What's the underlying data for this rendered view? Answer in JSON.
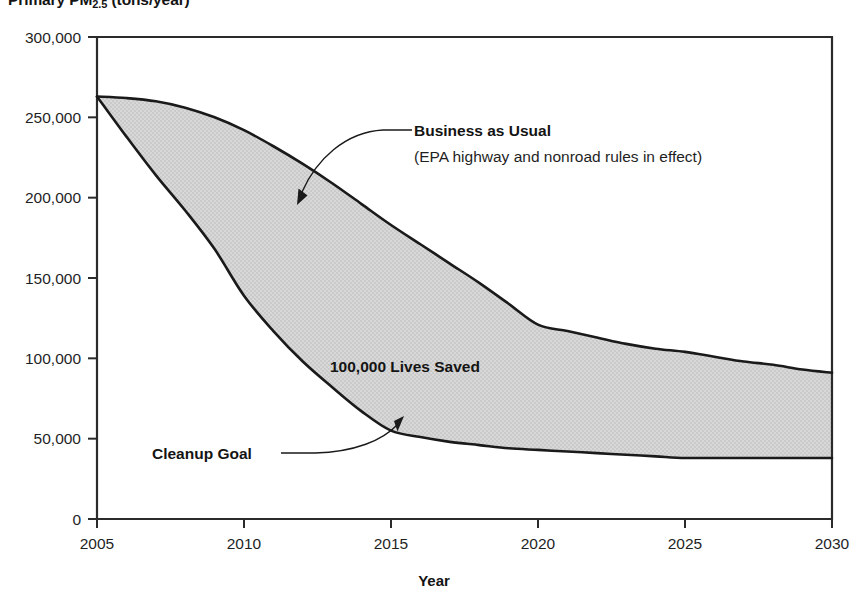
{
  "chart_data": {
    "type": "area",
    "title": "Primary PM2.5 (tons/year)",
    "title_prefix": "Primary PM",
    "title_sub": "2.5",
    "title_suffix": " (tons/year)",
    "xlabel": "Year",
    "ylabel": "Primary PM2.5 (tons/year)",
    "xlim": [
      2005,
      2030
    ],
    "ylim": [
      0,
      300000
    ],
    "grid": false,
    "legend_position": "inline-annotations",
    "x_ticks": [
      "2005",
      "2010",
      "2015",
      "2020",
      "2025",
      "2030"
    ],
    "x_tick_values": [
      2005,
      2010,
      2015,
      2020,
      2025,
      2030
    ],
    "y_ticks": [
      "0",
      "50,000",
      "100,000",
      "150,000",
      "200,000",
      "250,000",
      "300,000"
    ],
    "y_tick_values": [
      0,
      50000,
      100000,
      150000,
      200000,
      250000,
      300000
    ],
    "x": [
      2005,
      2006,
      2007,
      2008,
      2009,
      2010,
      2011,
      2012,
      2013,
      2014,
      2015,
      2016,
      2017,
      2018,
      2019,
      2020,
      2021,
      2022,
      2023,
      2024,
      2025,
      2026,
      2027,
      2028,
      2029,
      2030
    ],
    "series": [
      {
        "name": "Business as Usual",
        "sublabel": "(EPA highway and nonroad rules in effect)",
        "values": [
          263000,
          262000,
          260000,
          256000,
          250000,
          242000,
          232000,
          221000,
          209000,
          196000,
          183000,
          171000,
          159000,
          147000,
          134000,
          121000,
          117000,
          113000,
          109000,
          106000,
          104000,
          101000,
          98000,
          96000,
          93000,
          91000
        ]
      },
      {
        "name": "Cleanup Goal",
        "values": [
          263000,
          238000,
          214000,
          192000,
          168000,
          139000,
          117000,
          98000,
          82000,
          67000,
          55000,
          51000,
          48000,
          46000,
          44000,
          43000,
          42000,
          41000,
          40000,
          39000,
          38000,
          38000,
          38000,
          38000,
          38000,
          38000
        ]
      }
    ],
    "annotations": [
      {
        "id": "business-as-usual",
        "text": "Business as Usual",
        "subtext": "(EPA highway and nonroad rules in effect)",
        "bold": true,
        "points_to_year": 2012,
        "points_to_value": 215000
      },
      {
        "id": "lives-saved",
        "text": "100,000 Lives Saved",
        "bold": true,
        "position_year": 2016,
        "position_value": 105000
      },
      {
        "id": "cleanup-goal",
        "text": "Cleanup Goal",
        "bold": true,
        "points_to_year": 2015,
        "points_to_value": 62000
      }
    ],
    "colors": {
      "area_fill": "#d6d6d6",
      "line": "#1a1a1a",
      "axis": "#2b2b2b",
      "text": "#1a1a1a",
      "background": "#ffffff"
    }
  }
}
